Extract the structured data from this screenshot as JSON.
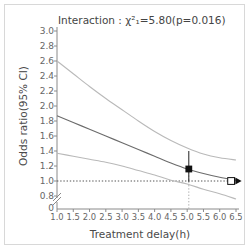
{
  "chart_data": {
    "type": "line",
    "title": "Interaction : χ²₁=5.80(p=0.016)",
    "xlabel": "Treatment delay(h)",
    "ylabel": "Odds ratio(95% CI)",
    "xlim": [
      1.0,
      6.5
    ],
    "ylim": [
      0.72,
      3.0
    ],
    "grid": false,
    "legend": "none",
    "y_axis_break": true,
    "y_break_labels": [
      "0.8",
      "0"
    ],
    "xticks": [
      "1.0",
      "1.5",
      "2.0",
      "2.5",
      "3.0",
      "3.5",
      "4.0",
      "4.5",
      "5.0",
      "5.5",
      "6.0",
      "6.5"
    ],
    "xtick_values": [
      1.0,
      1.5,
      2.0,
      2.5,
      3.0,
      3.5,
      4.0,
      4.5,
      5.0,
      5.5,
      6.0,
      6.5
    ],
    "yticks": [
      "3.0",
      "2.8",
      "2.6",
      "2.4",
      "2.2",
      "2.0",
      "1.8",
      "1.6",
      "1.4",
      "1.2",
      "1.0",
      "0.8",
      "0"
    ],
    "ytick_values": [
      3.0,
      2.8,
      2.6,
      2.4,
      2.2,
      2.0,
      1.8,
      1.6,
      1.4,
      1.2,
      1.0,
      0.8
    ],
    "reference_line": {
      "y": 1.0,
      "style": "dotted",
      "color": "#555555"
    },
    "series": [
      {
        "name": "Upper 95% CI",
        "style": "solid",
        "color": "#b9b9b9",
        "x": [
          1.0,
          1.5,
          2.0,
          2.5,
          3.0,
          3.5,
          4.0,
          4.5,
          5.0,
          5.5,
          6.0,
          6.5
        ],
        "values": [
          2.6,
          2.43,
          2.26,
          2.1,
          1.95,
          1.8,
          1.66,
          1.54,
          1.44,
          1.36,
          1.31,
          1.28
        ]
      },
      {
        "name": "Odds ratio (fitted)",
        "style": "solid",
        "color": "#6b6b6b",
        "x": [
          1.0,
          1.5,
          2.0,
          2.5,
          3.0,
          3.5,
          4.0,
          4.5,
          5.0,
          5.5,
          6.0,
          6.5
        ],
        "values": [
          1.87,
          1.78,
          1.69,
          1.6,
          1.51,
          1.42,
          1.33,
          1.24,
          1.16,
          1.1,
          1.05,
          1.01
        ]
      },
      {
        "name": "Lower 95% CI",
        "style": "solid",
        "color": "#b9b9b9",
        "x": [
          1.0,
          1.5,
          2.0,
          2.5,
          3.0,
          3.5,
          4.0,
          4.5,
          5.0,
          5.5,
          6.0,
          6.5
        ],
        "values": [
          1.37,
          1.33,
          1.29,
          1.25,
          1.2,
          1.14,
          1.08,
          1.01,
          0.96,
          0.89,
          0.83,
          0.76
        ]
      }
    ],
    "markers": [
      {
        "name": "observed-estimate",
        "shape": "filled-square",
        "x": 5.05,
        "y": 1.16,
        "error_bar": {
          "low": 0.99,
          "high": 1.4
        },
        "drop_line": {
          "style": "dotted",
          "to_y": 0.72
        },
        "color": "#111111"
      },
      {
        "name": "null-crossing-estimate",
        "shape": "open-square",
        "x": 6.35,
        "y": 1.0,
        "arrow": "right",
        "color": "#111111"
      }
    ]
  }
}
